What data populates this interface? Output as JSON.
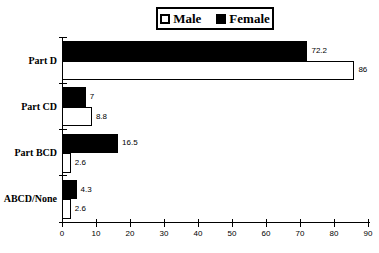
{
  "figure": {
    "background": "#ffffff",
    "foreground": "#000000"
  },
  "chart_data": {
    "type": "bar",
    "orientation": "horizontal",
    "title": "",
    "xlabel": "",
    "ylabel": "",
    "grid": false,
    "categories": [
      "Part D",
      "Part CD",
      "Part BCD",
      "ABCD/None"
    ],
    "series": [
      {
        "name": "Female",
        "fill": "#000000",
        "values": [
          72.2,
          7,
          16.5,
          4.3
        ],
        "labels": [
          "72.2",
          "7",
          "16.5",
          "4.3"
        ]
      },
      {
        "name": "Male",
        "fill": "#ffffff",
        "values": [
          86,
          8.8,
          2.6,
          2.6
        ],
        "labels": [
          "86",
          "8.8",
          "2.6",
          "2.6"
        ]
      }
    ],
    "row_order": [
      "Female",
      "Male"
    ],
    "x_axis": {
      "min": 0,
      "max": 90,
      "step": 10,
      "tick_labels": [
        "0",
        "10",
        "20",
        "30",
        "40",
        "50",
        "60",
        "70",
        "80",
        "90"
      ]
    },
    "legend": {
      "position": "top",
      "items": [
        {
          "label": "Male",
          "fill": "#ffffff"
        },
        {
          "label": "Female",
          "fill": "#000000"
        }
      ]
    }
  }
}
